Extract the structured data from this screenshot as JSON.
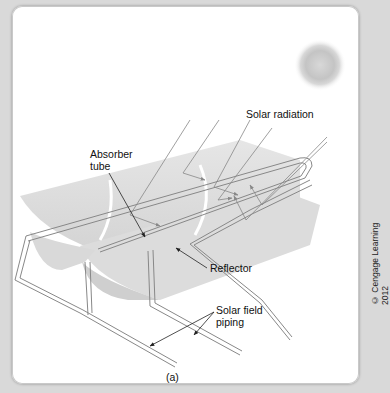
{
  "figure": {
    "caption": "(a)",
    "credit": "© Cengage Learning 2012",
    "labels": {
      "solar_radiation": "Solar radiation",
      "absorber_tube_line1": "Absorber",
      "absorber_tube_line2": "tube",
      "reflector": "Reflector",
      "solar_field_piping_line1": "Solar field",
      "solar_field_piping_line2": "piping"
    }
  }
}
